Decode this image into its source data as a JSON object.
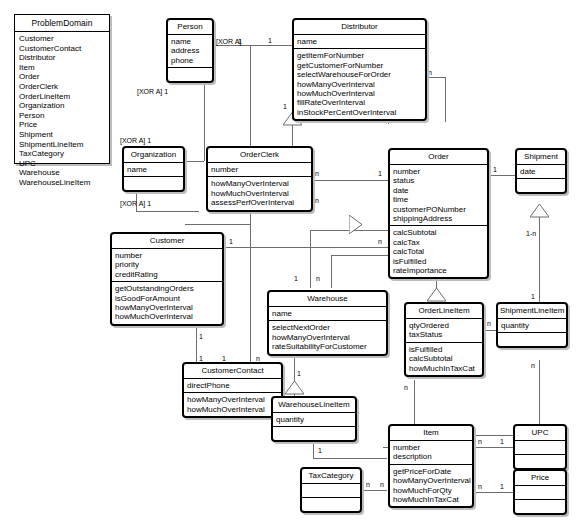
{
  "diagram": {
    "kind": "uml-class-diagram",
    "package_list": {
      "title": "ProblemDomain",
      "items": [
        "Customer",
        "CustomerContact",
        "Distributor",
        "Item",
        "Order",
        "OrderClerk",
        "OrderLineItem",
        "Organization",
        "Person",
        "Price",
        "Shipment",
        "ShipmentLineItem",
        "TaxCategory",
        "UPC",
        "Warehouse",
        "WarehouseLineItem"
      ]
    },
    "classes": {
      "person": {
        "name": "Person",
        "attributes": [
          "name",
          "address",
          "phone"
        ],
        "operations": []
      },
      "distributor": {
        "name": "Distributor",
        "attributes": [
          "name"
        ],
        "operations": [
          "getItemForNumber",
          "getCustomerForNumber",
          "selectWarehouseForOrder",
          "howManyOverInterval",
          "howMuchOverInterval",
          "fillRateOverInterval",
          "inStockPerCentOverInterval"
        ]
      },
      "organization": {
        "name": "Organization",
        "attributes": [
          "name"
        ],
        "operations": []
      },
      "orderclerk": {
        "name": "OrderClerk",
        "attributes": [
          "number"
        ],
        "operations": [
          "howManyOverInterval",
          "howMuchOverInterval",
          "assessPerfOverInterval"
        ]
      },
      "order": {
        "name": "Order",
        "attributes": [
          "number",
          "status",
          "date",
          "time",
          "customerPONumber",
          "shippingAddress"
        ],
        "operations": [
          "calcSubtotal",
          "calcTax",
          "calcTotal",
          "isFulfilled",
          "rateImportance"
        ]
      },
      "shipment": {
        "name": "Shipment",
        "attributes": [
          "date"
        ],
        "operations": []
      },
      "customer": {
        "name": "Customer",
        "attributes": [
          "number",
          "priority",
          "creditRating"
        ],
        "operations": [
          "getOutstandingOrders",
          "isGoodForAmount",
          "howManyOverInterval",
          "howMuchOverInterval"
        ]
      },
      "warehouse": {
        "name": "Warehouse",
        "attributes": [
          "name"
        ],
        "operations": [
          "selectNextOrder",
          "howManyOverInterval",
          "rateSuitabilityForCustomer"
        ]
      },
      "orderlineitem": {
        "name": "OrderLineItem",
        "attributes": [
          "qtyOrdered",
          "taxStatus"
        ],
        "operations": [
          "isFulfilled",
          "calcSubtotal",
          "howMuchInTaxCat"
        ]
      },
      "shipmentlineitem": {
        "name": "ShipmentLineItem",
        "attributes": [
          "quantity"
        ],
        "operations": []
      },
      "customercontact": {
        "name": "CustomerContact",
        "attributes": [
          "directPhone"
        ],
        "operations": [
          "howManyOverInterval",
          "howMuchOverInterval"
        ]
      },
      "warehouselineitem": {
        "name": "WarehouseLineItem",
        "attributes": [
          "quantity"
        ],
        "operations": []
      },
      "taxcategory": {
        "name": "TaxCategory",
        "attributes": [],
        "operations": []
      },
      "item": {
        "name": "Item",
        "attributes": [
          "number",
          "description"
        ],
        "operations": [
          "getPriceForDate",
          "howManyOverInterval",
          "howMuchForQty",
          "howMuchInTaxCat"
        ]
      },
      "upc": {
        "name": "UPC",
        "attributes": [],
        "operations": []
      },
      "price": {
        "name": "Price",
        "attributes": [],
        "operations": []
      }
    },
    "multiplicities": {
      "one": "1",
      "many": "n",
      "one_to_n": "1-n"
    },
    "constraints": {
      "xor": "[XOR A]"
    },
    "colors": {
      "line": "#6d6d6d",
      "border": "#000000",
      "shadow": "#bdbdbd",
      "background": "#ffffff"
    }
  }
}
